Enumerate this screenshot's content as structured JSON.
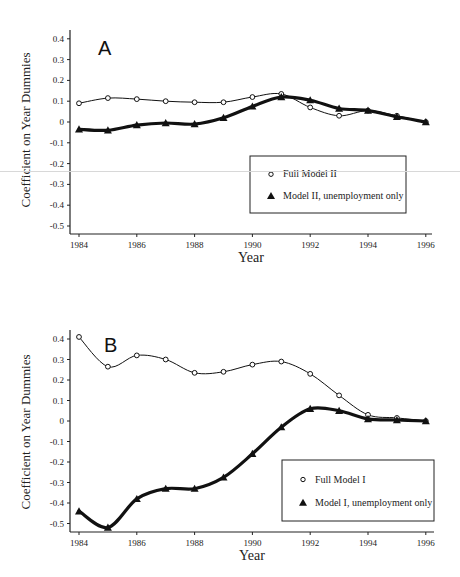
{
  "chart_data": [
    {
      "type": "line",
      "panel_label": "A",
      "title": "",
      "xlabel": "Year",
      "ylabel": "Coefficient on Year Dummies",
      "x": [
        1984,
        1985,
        1986,
        1987,
        1988,
        1989,
        1990,
        1991,
        1992,
        1993,
        1994,
        1995,
        1996
      ],
      "xticks": [
        "1984",
        "1986",
        "1988",
        "1990",
        "1992",
        "1994",
        "1996"
      ],
      "yticks": [
        "0.4",
        "0.3",
        "0.2",
        "0.1",
        "0",
        "-0.1",
        "-0.2",
        "-0.3",
        "-0.4",
        "-0.5"
      ],
      "ylim": [
        -0.5,
        0.4
      ],
      "xlim": [
        1984,
        1996
      ],
      "grid": false,
      "legend_position": "lower right",
      "series": [
        {
          "name": "Full Model II",
          "marker": "open-circle",
          "line": "thin",
          "values": [
            0.09,
            0.115,
            0.11,
            0.1,
            0.095,
            0.095,
            0.12,
            0.135,
            0.07,
            0.03,
            0.055,
            0.03,
            0.0
          ]
        },
        {
          "name": "Model II, unemployment only",
          "marker": "filled-triangle",
          "line": "thick",
          "values": [
            -0.035,
            -0.04,
            -0.015,
            -0.005,
            -0.01,
            0.02,
            0.075,
            0.12,
            0.105,
            0.065,
            0.055,
            0.025,
            0.0
          ]
        }
      ]
    },
    {
      "type": "line",
      "panel_label": "B",
      "title": "",
      "xlabel": "Year",
      "ylabel": "Coefficient on Year Dummies",
      "x": [
        1984,
        1985,
        1986,
        1987,
        1988,
        1989,
        1990,
        1991,
        1992,
        1993,
        1994,
        1995,
        1996
      ],
      "xticks": [
        "1984",
        "1986",
        "1988",
        "1990",
        "1992",
        "1994",
        "1996"
      ],
      "yticks": [
        "0.4",
        "0.3",
        "0.2",
        "0.1",
        "0",
        "-0.1",
        "-0.2",
        "-0.3",
        "-0.4",
        "-0.5"
      ],
      "ylim": [
        -0.5,
        0.4
      ],
      "xlim": [
        1984,
        1996
      ],
      "grid": false,
      "legend_position": "lower right",
      "series": [
        {
          "name": "Full Model I",
          "marker": "open-circle",
          "line": "thin",
          "values": [
            0.41,
            0.265,
            0.32,
            0.3,
            0.235,
            0.24,
            0.275,
            0.29,
            0.23,
            0.125,
            0.03,
            0.015,
            0.0
          ]
        },
        {
          "name": "Model I, unemployment only",
          "marker": "filled-triangle",
          "line": "thick",
          "values": [
            -0.44,
            -0.52,
            -0.38,
            -0.33,
            -0.33,
            -0.275,
            -0.16,
            -0.03,
            0.06,
            0.05,
            0.01,
            0.005,
            0.0
          ]
        }
      ]
    }
  ],
  "panels": [
    {
      "letter": "A",
      "xlabel": "Year",
      "ylabel": "Coefficient on Year Dummies",
      "legend": [
        "Full Model II",
        "Model II, unemployment only"
      ],
      "layout": {
        "x0": 70,
        "x1": 432,
        "year_x0": 79,
        "px_per_year": 28.9,
        "y_zero": 122,
        "px_per_unit": 208,
        "axis_y": 234,
        "y_top": 30,
        "legend_box": [
          250,
          156,
          156,
          57
        ],
        "letter_pos": [
          98,
          55
        ],
        "xlabel_y": 262,
        "ylabel_x": 30,
        "ylabel_y": 130
      }
    },
    {
      "letter": "B",
      "xlabel": "Year",
      "ylabel": "Coefficient on Year Dummies",
      "legend": [
        "Full Model I",
        "Model I, unemployment only"
      ],
      "layout": {
        "x0": 70,
        "x1": 434,
        "year_x0": 79,
        "px_per_year": 28.9,
        "y_zero": 131,
        "px_per_unit": 205,
        "axis_y": 242,
        "y_top": 40,
        "legend_box": [
          282,
          170,
          152,
          61
        ],
        "letter_pos": [
          104,
          62
        ],
        "xlabel_y": 270,
        "ylabel_x": 30,
        "ylabel_y": 142
      }
    }
  ]
}
